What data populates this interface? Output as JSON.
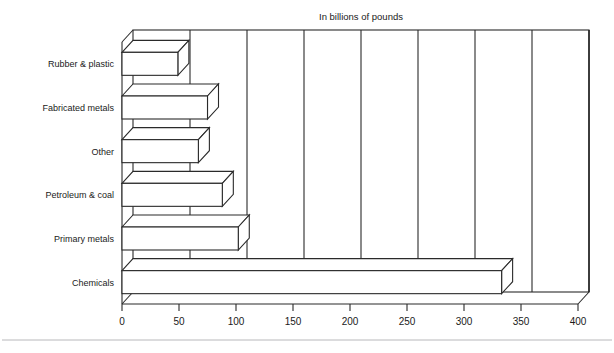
{
  "chart_data": {
    "type": "bar",
    "orientation": "horizontal",
    "style": "3d",
    "title": "In billions of pounds",
    "xlabel": "",
    "ylabel": "",
    "categories": [
      "Rubber & plastic",
      "Fabricated metals",
      "Other",
      "Petroleum & coal",
      "Primary  metals",
      "Chemicals"
    ],
    "values": [
      49,
      75,
      67,
      88,
      102,
      333
    ],
    "xlim": [
      0,
      400
    ],
    "xticks": [
      0,
      50,
      100,
      150,
      200,
      250,
      300,
      350,
      400
    ],
    "xtick_labels": [
      "0",
      "50",
      "100",
      "150",
      "200",
      "250",
      "300",
      "350",
      "400"
    ],
    "grid": true,
    "grid_axis": "x",
    "legend": false,
    "bar_fill": "#ffffff",
    "bar_edge": "#2a2a2a"
  },
  "title": {
    "text": "In billions of pounds"
  },
  "axis": {
    "tick_labels": [
      "0",
      "50",
      "100",
      "150",
      "200",
      "250",
      "300",
      "350",
      "400"
    ]
  },
  "categories": {
    "labels": [
      "Rubber & plastic",
      "Fabricated metals",
      "Other",
      "Petroleum & coal",
      "Primary  metals",
      "Chemicals"
    ]
  }
}
